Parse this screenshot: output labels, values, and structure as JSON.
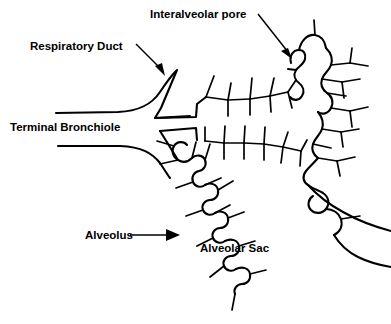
{
  "figure": {
    "background_color": "#ffffff",
    "line_color": "#000000",
    "text_color": "#000000",
    "width": 391,
    "height": 324
  },
  "labels": {
    "interalveolar_pore": "Interalveolar pore",
    "respiratory_duct": "Respiratory Duct",
    "terminal_bronchiole": "Terminal Bronchiole",
    "alveolus": "Alveolus",
    "alveolar_sac": "Alveolar Sac"
  },
  "annotations": [
    {
      "id": "interalveolar-pore",
      "label": "Interalveolar pore",
      "has_arrow": true,
      "arrow_direction": "down-left",
      "text_x": 150,
      "text_y": 18,
      "target_x": 288,
      "target_y": 58
    },
    {
      "id": "respiratory-duct",
      "label": "Respiratory Duct",
      "has_arrow": true,
      "arrow_direction": "down-right",
      "text_x": 30,
      "text_y": 50,
      "target_x": 163,
      "target_y": 76
    },
    {
      "id": "terminal-bronchiole",
      "label": "Terminal Bronchiole",
      "has_arrow": false,
      "arrow_direction": "none",
      "text_x": 10,
      "text_y": 131,
      "target_x": 0,
      "target_y": 0
    },
    {
      "id": "alveolus",
      "label": "Alveolus",
      "has_arrow": true,
      "arrow_direction": "right",
      "text_x": 85,
      "text_y": 239,
      "target_x": 176,
      "target_y": 235
    },
    {
      "id": "alveolar-sac",
      "label": "Alveolar Sac",
      "has_arrow": false,
      "arrow_direction": "none",
      "text_x": 200,
      "text_y": 252,
      "target_x": 0,
      "target_y": 0
    }
  ],
  "structures": [
    {
      "id": "terminal-bronchiole-upper-wall",
      "name": "terminal bronchiole upper wall"
    },
    {
      "id": "terminal-bronchiole-lower-wall",
      "name": "terminal bronchiole lower wall"
    },
    {
      "id": "respiratory-duct-upper-wall",
      "name": "respiratory duct upper wall"
    },
    {
      "id": "respiratory-duct-lower-wall",
      "name": "respiratory duct lower wall"
    },
    {
      "id": "upper-alveolar-sac",
      "name": "upper right alveolar sac"
    },
    {
      "id": "lower-alveolar-sac",
      "name": "lower alveolar sac"
    },
    {
      "id": "interalveolar-pore-gap",
      "name": "interalveolar pore gap in septum"
    }
  ]
}
